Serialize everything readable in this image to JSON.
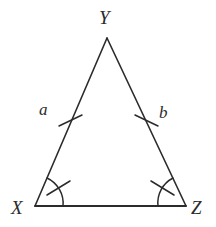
{
  "figure": {
    "kind": "geometry-diagram",
    "shape": "isosceles-triangle",
    "background_color": "#ffffff",
    "stroke_color": "#2b2b2b",
    "canvas": {
      "width": 216,
      "height": 227
    }
  },
  "vertices": [
    {
      "id": "Y",
      "label": "Y",
      "x": 107,
      "y": 38,
      "name": "apex-vertex"
    },
    {
      "id": "X",
      "label": "X",
      "x": 35,
      "y": 206,
      "name": "bottom-left-vertex"
    },
    {
      "id": "Z",
      "label": "Z",
      "x": 186,
      "y": 206,
      "name": "bottom-right-vertex"
    }
  ],
  "sides": [
    {
      "id": "XY",
      "label": "a",
      "from": "X",
      "to": "Y",
      "tick_count": 1
    },
    {
      "id": "YZ",
      "label": "b",
      "from": "Y",
      "to": "Z",
      "tick_count": 1
    },
    {
      "id": "XZ",
      "label": "",
      "from": "X",
      "to": "Z",
      "tick_count": 0
    }
  ],
  "angle_marks": [
    {
      "at": "X",
      "arc_count": 1,
      "tick_count": 1
    },
    {
      "at": "Z",
      "arc_count": 1,
      "tick_count": 1
    }
  ],
  "labels": {
    "apex": "Y",
    "bottom_left": "X",
    "bottom_right": "Z",
    "left_side": "a",
    "right_side": "b"
  }
}
